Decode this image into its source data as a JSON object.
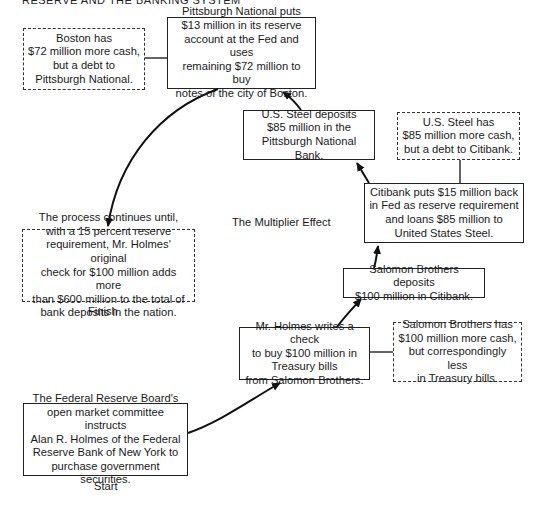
{
  "header": {
    "text": "RESERVE AND THE BANKING SYSTEM"
  },
  "diagram": {
    "title": "The Multiplier Effect",
    "start_label": "Start",
    "finish_label": "Finish",
    "nodes": {
      "fed_board": {
        "text": "The Federal Reserve Board's\nopen market committee instructs\nAlan R. Holmes of the Federal\nReserve Bank of New York to\npurchase government securities.",
        "style": "solid"
      },
      "holmes_check": {
        "text": "Mr. Holmes writes a check\nto buy $100 million in\nTreasury bills\nfrom Salomon Brothers.",
        "style": "solid"
      },
      "salomon_has": {
        "text": "Salomon Brothers has\n$100 million more cash,\nbut correspondingly less\nin Treasury bills.",
        "style": "dashed"
      },
      "salomon_deposits": {
        "text": "Salomon Brothers deposits\n$100 million in Citibank.",
        "style": "solid"
      },
      "citibank_puts": {
        "text": "Citibank puts $15 million back\nin Fed as reserve requirement\nand loans $85 million to\nUnited States Steel.",
        "style": "solid"
      },
      "steel_has": {
        "text": "U.S. Steel has\n$85 million more cash,\nbut a debt to Citibank.",
        "style": "dashed"
      },
      "steel_deposits": {
        "text": "U.S. Steel deposits\n$85 million in the\nPittsburgh National Bank.",
        "style": "solid"
      },
      "pittsburgh_puts": {
        "text": "Pittsburgh National puts\n$13 million in its reserve\naccount at the Fed and uses\nremaining $72 million to buy\nnotes of the city of Boston.",
        "style": "solid"
      },
      "boston_has": {
        "text": "Boston has\n$72 million more cash,\nbut a debt to\nPittsburgh National.",
        "style": "dashed"
      },
      "process_continues": {
        "text": "The process continues until,\nwith a 15 percent reserve\nrequirement, Mr. Holmes' original\ncheck for $100 million adds more\nthan $600 million to the total of\nbank deposits in the nation.",
        "style": "dashed"
      }
    },
    "edges": [
      {
        "from": "fed_board",
        "to": "holmes_check",
        "type": "arrow"
      },
      {
        "from": "holmes_check",
        "to": "salomon_has",
        "type": "line"
      },
      {
        "from": "holmes_check",
        "to": "salomon_deposits",
        "type": "arrow"
      },
      {
        "from": "salomon_deposits",
        "to": "citibank_puts",
        "type": "arrow"
      },
      {
        "from": "citibank_puts",
        "to": "steel_has",
        "type": "line"
      },
      {
        "from": "citibank_puts",
        "to": "steel_deposits",
        "type": "arrow"
      },
      {
        "from": "steel_deposits",
        "to": "pittsburgh_puts",
        "type": "arrow"
      },
      {
        "from": "pittsburgh_puts",
        "to": "boston_has",
        "type": "line"
      },
      {
        "from": "pittsburgh_puts",
        "to": "process_continues",
        "type": "arrow"
      }
    ]
  }
}
